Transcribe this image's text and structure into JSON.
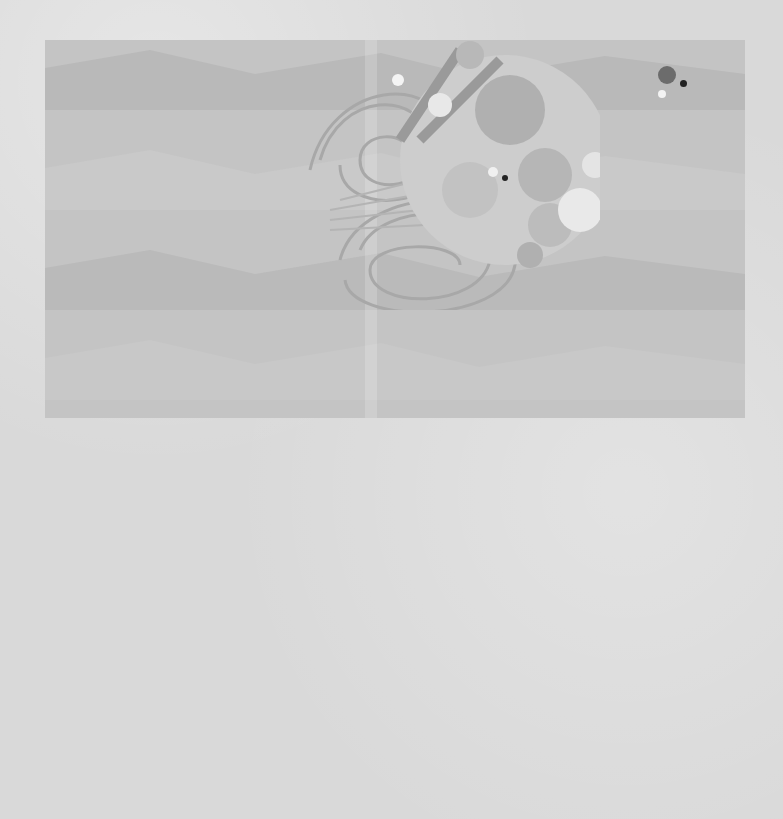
{
  "page": {
    "style": "grayscale picture-book spread"
  },
  "top_panel": {
    "caption": "Frankie was amazed.",
    "body": {
      "line1": "When he played the trumpet he could",
      "line2_pre": "not only ",
      "line2_bold": "hear",
      "line2_post": " the sounds, but he",
      "line3_pre": "could ",
      "line3_bold1": "see",
      "line3_mid": " and ",
      "line3_bold2": "smell",
      "line3_post": " them too!"
    },
    "illustration": {
      "character": "Frankie",
      "instrument": "trumpet"
    }
  },
  "bottom_panel": {
    "smells": [
      {
        "label": "burnt toast",
        "icon": "toast-icon"
      },
      {
        "label": "coffee",
        "icon": "coffee-beans-icon"
      },
      {
        "label": "cherry",
        "icon": "cherry-icon"
      },
      {
        "label": "sausages",
        "icon": "sausage-icon"
      }
    ]
  },
  "colors": {
    "background": "#d9d9d9",
    "panel": "#c4c4c4",
    "text": "#1e1e1e",
    "dark_disc": "#2e2e2e",
    "mid_disc": "#6e6e6e"
  }
}
